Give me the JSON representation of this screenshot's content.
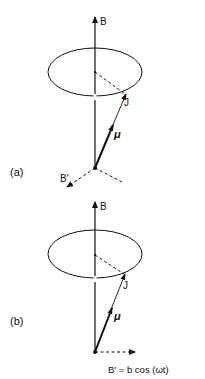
{
  "figure": {
    "panels": [
      {
        "id": "a",
        "label": "(a)",
        "field_label": "B",
        "precession_label": "J",
        "moment_label": "μ",
        "perturbing_field_label": "B′"
      },
      {
        "id": "b",
        "label": "(b)",
        "field_label": "B",
        "precession_label": "J",
        "moment_label": "μ",
        "perturbing_field_label": "B′ = b cos (ωt)"
      }
    ],
    "colors": {
      "ink": "#111111",
      "background": "#ffffff"
    }
  }
}
